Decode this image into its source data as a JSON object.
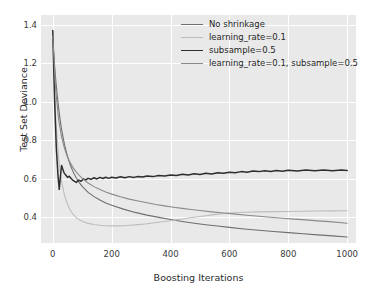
{
  "chart_data": {
    "type": "line",
    "title": "",
    "xlabel": "Boosting Iterations",
    "ylabel": "Test Set Deviance",
    "xlim": [
      -40,
      1030
    ],
    "ylim": [
      0.265,
      1.45
    ],
    "xticks": [
      0,
      200,
      400,
      600,
      800,
      1000
    ],
    "xticklabels": [
      "0",
      "200",
      "400",
      "600",
      "800",
      "1000"
    ],
    "yticks": [
      0.4,
      0.6,
      0.8,
      1.0,
      1.2,
      1.4
    ],
    "yticklabels": [
      "0.4",
      "0.6",
      "0.8",
      "1.0",
      "1.2",
      "1.4"
    ],
    "grid": true,
    "grid_color": "#ffffff",
    "axes_facecolor": "#e9e9e9",
    "figure_facecolor": "#ffffff",
    "legend_position": "upper right",
    "series": [
      {
        "name": "No shrinkage",
        "color": "#6f6f6f",
        "linewidth": 1.1,
        "x": [
          0,
          5,
          10,
          15,
          20,
          25,
          30,
          40,
          50,
          60,
          70,
          80,
          90,
          100,
          120,
          140,
          160,
          180,
          200,
          240,
          280,
          320,
          360,
          400,
          440,
          480,
          520,
          560,
          600,
          650,
          700,
          750,
          800,
          850,
          900,
          950,
          1000
        ],
        "y": [
          1.325,
          1.21,
          1.115,
          1.035,
          0.965,
          0.905,
          0.855,
          0.775,
          0.715,
          0.668,
          0.632,
          0.603,
          0.579,
          0.559,
          0.528,
          0.506,
          0.488,
          0.473,
          0.461,
          0.441,
          0.424,
          0.41,
          0.398,
          0.387,
          0.377,
          0.368,
          0.36,
          0.353,
          0.346,
          0.338,
          0.331,
          0.325,
          0.319,
          0.313,
          0.307,
          0.302,
          0.296
        ]
      },
      {
        "name": "learning_rate=0.1",
        "color": "#bdbdbd",
        "linewidth": 1.1,
        "x": [
          0,
          10,
          20,
          30,
          40,
          50,
          60,
          70,
          80,
          90,
          100,
          120,
          140,
          160,
          180,
          200,
          220,
          240,
          260,
          280,
          300,
          320,
          340,
          360,
          380,
          400,
          420,
          440,
          460,
          480,
          500,
          520,
          540,
          560,
          580,
          600,
          650,
          700,
          750,
          800,
          850,
          900,
          950,
          1000
        ],
        "y": [
          1.335,
          0.905,
          0.7,
          0.583,
          0.512,
          0.466,
          0.434,
          0.412,
          0.397,
          0.386,
          0.378,
          0.367,
          0.361,
          0.357,
          0.355,
          0.354,
          0.354,
          0.355,
          0.357,
          0.359,
          0.362,
          0.365,
          0.369,
          0.373,
          0.377,
          0.381,
          0.386,
          0.39,
          0.395,
          0.399,
          0.403,
          0.407,
          0.411,
          0.415,
          0.418,
          0.421,
          0.425,
          0.427,
          0.428,
          0.429,
          0.43,
          0.431,
          0.432,
          0.433
        ]
      },
      {
        "name": "subsample=0.5",
        "color": "#2e2e2e",
        "linewidth": 1.5,
        "x": [
          0,
          6,
          12,
          18,
          22,
          26,
          30,
          34,
          38,
          44,
          50,
          56,
          62,
          68,
          74,
          80,
          88,
          96,
          104,
          112,
          120,
          130,
          140,
          150,
          160,
          170,
          180,
          190,
          200,
          215,
          230,
          245,
          260,
          275,
          290,
          305,
          320,
          340,
          360,
          380,
          400,
          420,
          440,
          460,
          480,
          500,
          520,
          540,
          560,
          580,
          600,
          620,
          640,
          660,
          680,
          700,
          720,
          740,
          760,
          780,
          800,
          830,
          860,
          890,
          920,
          950,
          980,
          1000
        ],
        "y": [
          1.37,
          1.015,
          0.76,
          0.612,
          0.544,
          0.612,
          0.668,
          0.649,
          0.631,
          0.618,
          0.606,
          0.612,
          0.6,
          0.592,
          0.585,
          0.58,
          0.592,
          0.586,
          0.598,
          0.593,
          0.601,
          0.596,
          0.604,
          0.598,
          0.606,
          0.6,
          0.607,
          0.601,
          0.607,
          0.603,
          0.609,
          0.604,
          0.61,
          0.606,
          0.611,
          0.608,
          0.613,
          0.61,
          0.616,
          0.613,
          0.619,
          0.616,
          0.622,
          0.619,
          0.625,
          0.621,
          0.627,
          0.624,
          0.63,
          0.627,
          0.633,
          0.63,
          0.636,
          0.633,
          0.639,
          0.636,
          0.641,
          0.637,
          0.642,
          0.638,
          0.643,
          0.639,
          0.644,
          0.64,
          0.645,
          0.641,
          0.645,
          0.642
        ]
      },
      {
        "name": "learning_rate=0.1, subsample=0.5",
        "color": "#8a8a8a",
        "linewidth": 1.1,
        "x": [
          0,
          10,
          20,
          30,
          40,
          50,
          60,
          70,
          80,
          90,
          100,
          120,
          140,
          160,
          180,
          200,
          230,
          260,
          290,
          320,
          350,
          380,
          410,
          440,
          470,
          500,
          540,
          580,
          620,
          660,
          700,
          740,
          780,
          820,
          860,
          900,
          940,
          1000
        ],
        "y": [
          1.34,
          1.06,
          0.905,
          0.815,
          0.756,
          0.712,
          0.68,
          0.654,
          0.633,
          0.616,
          0.601,
          0.577,
          0.558,
          0.543,
          0.53,
          0.519,
          0.505,
          0.493,
          0.483,
          0.474,
          0.465,
          0.458,
          0.451,
          0.445,
          0.439,
          0.434,
          0.427,
          0.421,
          0.415,
          0.409,
          0.404,
          0.399,
          0.394,
          0.389,
          0.385,
          0.38,
          0.376,
          0.368
        ]
      }
    ]
  },
  "legend": {
    "entries": [
      {
        "label": "No shrinkage",
        "color": "#6f6f6f",
        "width": "1.1px"
      },
      {
        "label": "learning_rate=0.1",
        "color": "#bdbdbd",
        "width": "1.1px"
      },
      {
        "label": "subsample=0.5",
        "color": "#2e2e2e",
        "width": "1.8px"
      },
      {
        "label": "learning_rate=0.1, subsample=0.5",
        "color": "#8a8a8a",
        "width": "1.2px"
      }
    ]
  }
}
